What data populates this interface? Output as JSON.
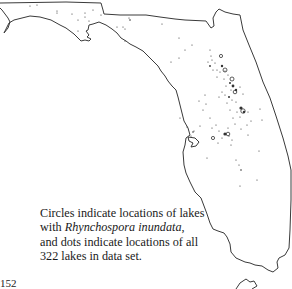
{
  "map": {
    "title": "Florida lakes map",
    "outline_color": "#3a3a3a",
    "dot_color": "#333333"
  },
  "caption": {
    "line1": "Circles indicate locations of lakes",
    "line2_prefix": "with ",
    "species": "Rhynchospora inundata",
    "line2_suffix": ",",
    "line3": "and dots indicate locations of all",
    "line4": "322 lakes in data set."
  },
  "page_number": "152"
}
